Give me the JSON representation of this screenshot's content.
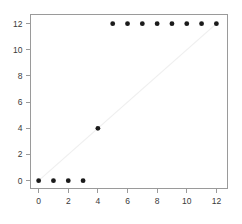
{
  "chart_data": {
    "type": "scatter",
    "title": "",
    "subtitle": "",
    "xlabel": "",
    "ylabel": "",
    "xlim": [
      -0.55,
      12.75
    ],
    "ylim": [
      -0.6,
      12.7
    ],
    "grid": false,
    "legend": null,
    "xticks": [
      0,
      2,
      4,
      6,
      8,
      10,
      12
    ],
    "xtick_labels": [
      "0",
      "2",
      "4",
      "6",
      "8",
      "10",
      "12"
    ],
    "yticks": [
      0,
      2,
      4,
      6,
      8,
      10,
      12
    ],
    "ytick_labels": [
      "0",
      "2",
      "4",
      "6",
      "8",
      "10",
      "12"
    ],
    "series": [
      {
        "name": "points",
        "marker": "filled-circle",
        "color": "#1a1a1a",
        "x": [
          0,
          1,
          2,
          3,
          4,
          5,
          6,
          7,
          8,
          9,
          10,
          11,
          12
        ],
        "y": [
          0,
          0,
          0,
          0,
          4,
          12,
          12,
          12,
          12,
          12,
          12,
          12,
          12
        ]
      }
    ],
    "annotations": [
      {
        "name": "identity-reference-line",
        "type": "line",
        "color": "#efefef",
        "x_start": 0,
        "y_start": 0,
        "x_end": 12,
        "y_end": 12
      }
    ]
  },
  "axes": {
    "x_tick_labels": [
      "0",
      "2",
      "4",
      "6",
      "8",
      "10",
      "12"
    ],
    "y_tick_labels": [
      "0",
      "2",
      "4",
      "6",
      "8",
      "10",
      "12"
    ]
  }
}
